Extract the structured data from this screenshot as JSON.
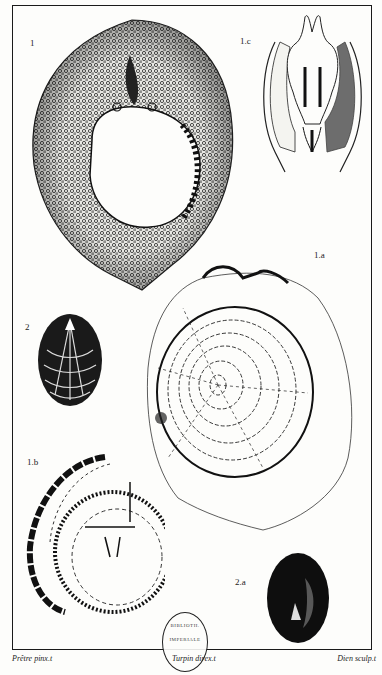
{
  "plate": {
    "figures": [
      {
        "id": "fig-1",
        "label": "1",
        "description": "shell with perforated interior, heavily stippled rim"
      },
      {
        "id": "fig-1c",
        "label": "1.c",
        "description": "animal anatomy inside shell outline"
      },
      {
        "id": "fig-1a",
        "label": "1.a",
        "description": "shell with concentric growth rings and radial lines"
      },
      {
        "id": "fig-2",
        "label": "2",
        "description": "small oval ribbed shell, dark"
      },
      {
        "id": "fig-1b",
        "label": "1.b",
        "description": "worn shell with concentric bands"
      },
      {
        "id": "fig-2a",
        "label": "2.a",
        "description": "small dark oval shell underside"
      }
    ],
    "credits": {
      "left": "Prêtre pinx.t",
      "center": "Turpin direx.t",
      "right": "Dien sculp.t"
    },
    "stamp": {
      "line1": "BIBLIOTH.",
      "line2": "IMPERIALE"
    },
    "colors": {
      "ink": "#111111",
      "paper": "#fdfdfb"
    }
  }
}
